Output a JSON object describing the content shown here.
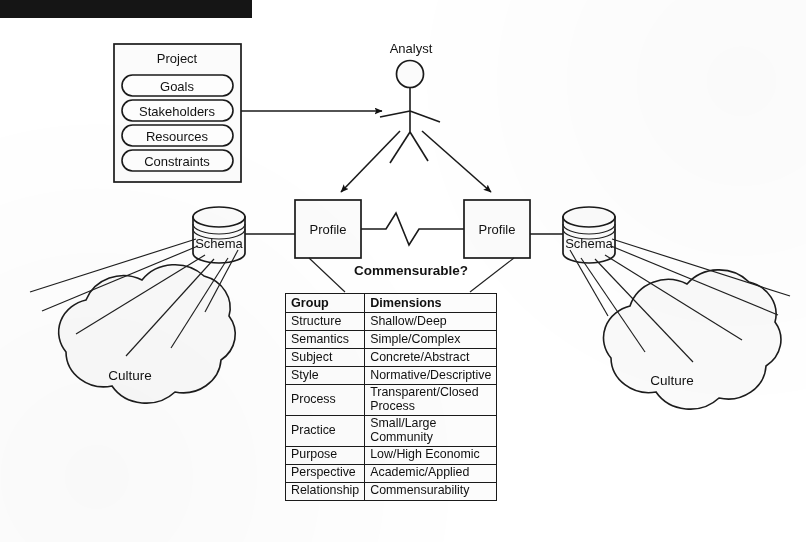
{
  "page": {
    "header_bar_text": "",
    "header_note": ""
  },
  "diagram": {
    "project_box": {
      "title": "Project",
      "items": [
        {
          "label": "Goals"
        },
        {
          "label": "Stakeholders"
        },
        {
          "label": "Resources"
        },
        {
          "label": "Constraints"
        }
      ]
    },
    "actor": {
      "label": "Analyst",
      "icon": "stick-figure-icon"
    },
    "profiles": [
      {
        "label": "Profile",
        "side": "left"
      },
      {
        "label": "Profile",
        "side": "right"
      }
    ],
    "connector_label": "Commensurable?",
    "connector_style": "zigzag-break-line",
    "schemas": [
      {
        "label": "Schema",
        "side": "left",
        "icon": "database-cylinder-icon"
      },
      {
        "label": "Schema",
        "side": "right",
        "icon": "database-cylinder-icon"
      }
    ],
    "cultures": [
      {
        "label": "Culture",
        "side": "left",
        "icon": "cloud-icon"
      },
      {
        "label": "Culture",
        "side": "right",
        "icon": "cloud-icon"
      }
    ]
  },
  "table": {
    "headers": [
      "Group",
      "Dimensions"
    ],
    "rows": [
      {
        "group": "Structure",
        "dimensions": "Shallow/Deep"
      },
      {
        "group": "Semantics",
        "dimensions": "Simple/Complex"
      },
      {
        "group": "Subject",
        "dimensions": "Concrete/Abstract"
      },
      {
        "group": "Style",
        "dimensions": "Normative/Descriptive"
      },
      {
        "group": "Process",
        "dimensions": "Transparent/Closed Process"
      },
      {
        "group": "Practice",
        "dimensions": "Small/Large Community"
      },
      {
        "group": "Purpose",
        "dimensions": "Low/High Economic"
      },
      {
        "group": "Perspective",
        "dimensions": "Academic/Applied"
      },
      {
        "group": "Relationship",
        "dimensions": "Commensurability"
      }
    ]
  },
  "colors": {
    "ink": "#1a1a1a",
    "paper": "#ffffff",
    "fill": "#fbfbfb",
    "bar": "#151515"
  }
}
